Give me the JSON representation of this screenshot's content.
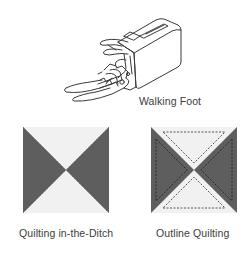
{
  "figures": {
    "walking_foot": {
      "label": "Walking Foot",
      "icon": "walking-foot-presser-foot-illustration"
    },
    "quilting_in_the_ditch": {
      "label": "Quilting in-the-Ditch",
      "icon": "hourglass-block-diagram"
    },
    "outline_quilting": {
      "label": "Outline Quilting",
      "icon": "hourglass-block-outline-stitch-diagram"
    }
  },
  "colors": {
    "dark_fabric": "#5e5e5e",
    "light_fabric": "#f1f1f1",
    "stitch_line": "#2e2e2e",
    "line_art": "#3a3a3a",
    "text": "#3c3c3c"
  }
}
